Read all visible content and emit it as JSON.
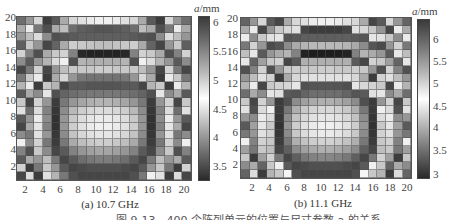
{
  "figure": {
    "caption": "图 9-13　400 个阵列单元的位置与尺寸参数 a 的关系"
  },
  "panels": [
    {
      "subcaption": "(a) 10.7 GHz",
      "colorbar_title_var": "a",
      "colorbar_title_unit": "/mm",
      "colorbar_ticks": [
        "6",
        "5.5",
        "5",
        "4.5",
        "4",
        "3.5"
      ],
      "y_ticks": [
        "20",
        "18",
        "16",
        "14",
        "12",
        "10",
        "8",
        "6",
        "4",
        "2"
      ],
      "x_ticks": [
        "2",
        "4",
        "6",
        "8",
        "10",
        "12",
        "14",
        "16",
        "18",
        "20"
      ]
    },
    {
      "subcaption": "(b) 11.1 GHz",
      "colorbar_title_var": "a",
      "colorbar_title_unit": "/mm",
      "colorbar_ticks": [
        "6",
        "5.5",
        "5",
        "4.5",
        "4",
        "3.5",
        "3"
      ],
      "y_ticks": [
        "20",
        "18",
        "16",
        "14",
        "12",
        "10",
        "8",
        "6",
        "4",
        "2"
      ],
      "x_ticks": [
        "2",
        "4",
        "6",
        "8",
        "10",
        "12",
        "14",
        "16",
        "18",
        "20"
      ]
    }
  ],
  "chart_data": [
    {
      "type": "heatmap",
      "title": "(a) 10.7 GHz",
      "xlabel": "",
      "ylabel": "",
      "x": [
        1,
        2,
        3,
        4,
        5,
        6,
        7,
        8,
        9,
        10,
        11,
        12,
        13,
        14,
        15,
        16,
        17,
        18,
        19,
        20
      ],
      "y_top_to_bottom": [
        20,
        19,
        18,
        17,
        16,
        15,
        14,
        13,
        12,
        11,
        10,
        9,
        8,
        7,
        6,
        5,
        4,
        3,
        2,
        1
      ],
      "colorbar": {
        "label": "a/mm",
        "range": [
          3.2,
          6.3
        ],
        "ticks": [
          6,
          5.5,
          5,
          4.5,
          4,
          3.5
        ],
        "colormap": "gray: dark at ends, white near 5"
      },
      "gray_levels_note": "0=black, 255=white; rows from y=20 (top) to y=1 (bottom)",
      "gray": [
        [
          110,
          150,
          215,
          60,
          90,
          170,
          215,
          225,
          235,
          240,
          240,
          235,
          225,
          215,
          170,
          90,
          60,
          215,
          150,
          110
        ],
        [
          170,
          235,
          120,
          80,
          170,
          190,
          110,
          95,
          90,
          85,
          85,
          90,
          95,
          110,
          190,
          170,
          80,
          120,
          235,
          170
        ],
        [
          150,
          190,
          220,
          140,
          80,
          85,
          90,
          95,
          95,
          95,
          95,
          95,
          95,
          90,
          85,
          80,
          140,
          220,
          190,
          150
        ],
        [
          95,
          200,
          150,
          70,
          100,
          170,
          205,
          200,
          195,
          190,
          190,
          195,
          200,
          205,
          170,
          100,
          70,
          150,
          200,
          95
        ],
        [
          210,
          130,
          80,
          170,
          200,
          210,
          130,
          40,
          35,
          35,
          35,
          35,
          40,
          130,
          210,
          200,
          170,
          80,
          130,
          210
        ],
        [
          140,
          90,
          150,
          180,
          220,
          240,
          80,
          180,
          175,
          175,
          175,
          175,
          180,
          80,
          240,
          220,
          180,
          150,
          90,
          140
        ],
        [
          70,
          120,
          210,
          70,
          150,
          190,
          200,
          200,
          200,
          205,
          205,
          200,
          200,
          200,
          190,
          150,
          70,
          210,
          120,
          70
        ],
        [
          120,
          200,
          235,
          60,
          170,
          215,
          150,
          120,
          115,
          115,
          115,
          115,
          120,
          150,
          215,
          170,
          60,
          235,
          200,
          120
        ],
        [
          180,
          235,
          60,
          200,
          180,
          70,
          90,
          90,
          85,
          85,
          85,
          85,
          90,
          90,
          70,
          180,
          200,
          60,
          235,
          180
        ],
        [
          90,
          170,
          140,
          230,
          80,
          100,
          110,
          115,
          120,
          120,
          120,
          120,
          115,
          110,
          100,
          80,
          230,
          140,
          170,
          90
        ],
        [
          200,
          70,
          210,
          150,
          60,
          120,
          150,
          165,
          175,
          180,
          180,
          175,
          165,
          150,
          120,
          60,
          150,
          210,
          70,
          200
        ],
        [
          225,
          110,
          220,
          130,
          55,
          140,
          185,
          205,
          215,
          220,
          220,
          215,
          205,
          185,
          140,
          55,
          130,
          220,
          110,
          225
        ],
        [
          90,
          150,
          235,
          140,
          50,
          150,
          200,
          220,
          230,
          235,
          235,
          230,
          220,
          200,
          150,
          50,
          140,
          235,
          150,
          90
        ],
        [
          70,
          170,
          230,
          130,
          50,
          150,
          205,
          225,
          235,
          240,
          240,
          235,
          225,
          205,
          150,
          50,
          130,
          230,
          170,
          70
        ],
        [
          140,
          120,
          225,
          150,
          55,
          140,
          195,
          215,
          225,
          230,
          230,
          225,
          215,
          195,
          140,
          55,
          150,
          225,
          120,
          140
        ],
        [
          240,
          140,
          210,
          120,
          60,
          120,
          170,
          190,
          200,
          205,
          205,
          200,
          190,
          170,
          120,
          60,
          120,
          210,
          140,
          240
        ],
        [
          130,
          80,
          200,
          140,
          70,
          90,
          130,
          150,
          160,
          165,
          165,
          160,
          150,
          130,
          90,
          70,
          140,
          200,
          80,
          130
        ],
        [
          90,
          170,
          150,
          190,
          120,
          70,
          90,
          110,
          120,
          125,
          125,
          120,
          110,
          90,
          70,
          120,
          190,
          150,
          170,
          90
        ],
        [
          210,
          60,
          120,
          200,
          150,
          90,
          70,
          75,
          80,
          80,
          80,
          80,
          75,
          70,
          90,
          150,
          200,
          120,
          60,
          210
        ],
        [
          70,
          220,
          60,
          225,
          180,
          120,
          80,
          70,
          70,
          70,
          70,
          70,
          70,
          80,
          120,
          240,
          225,
          60,
          220,
          70
        ]
      ]
    },
    {
      "type": "heatmap",
      "title": "(b) 11.1 GHz",
      "xlabel": "",
      "ylabel": "",
      "x": [
        1,
        2,
        3,
        4,
        5,
        6,
        7,
        8,
        9,
        10,
        11,
        12,
        13,
        14,
        15,
        16,
        17,
        18,
        19,
        20
      ],
      "y_top_to_bottom": [
        20,
        19,
        18,
        17,
        16,
        15,
        14,
        13,
        12,
        11,
        10,
        9,
        8,
        7,
        6,
        5,
        4,
        3,
        2,
        1
      ],
      "colorbar": {
        "label": "a/mm",
        "range": [
          2.85,
          6.5
        ],
        "ticks": [
          6,
          5.5,
          5,
          4.5,
          4,
          3.5,
          3
        ],
        "colormap": "gray: dark at ends, white near 5"
      },
      "gray_levels_note": "0=black, 255=white; rows from y=20 (top) to y=1 (bottom)",
      "gray": [
        [
          100,
          150,
          215,
          90,
          70,
          170,
          215,
          225,
          235,
          240,
          240,
          235,
          225,
          215,
          170,
          70,
          90,
          215,
          150,
          100
        ],
        [
          170,
          235,
          70,
          150,
          200,
          215,
          225,
          70,
          60,
          60,
          60,
          60,
          70,
          225,
          215,
          200,
          150,
          70,
          235,
          170
        ],
        [
          235,
          140,
          200,
          225,
          230,
          85,
          90,
          95,
          95,
          95,
          95,
          95,
          95,
          90,
          85,
          230,
          225,
          200,
          140,
          235
        ],
        [
          120,
          210,
          150,
          75,
          85,
          140,
          170,
          180,
          185,
          185,
          185,
          185,
          180,
          170,
          140,
          85,
          75,
          150,
          210,
          120
        ],
        [
          190,
          230,
          90,
          150,
          170,
          180,
          130,
          35,
          30,
          30,
          30,
          30,
          35,
          130,
          180,
          170,
          150,
          90,
          230,
          190
        ],
        [
          230,
          100,
          160,
          200,
          210,
          70,
          90,
          175,
          175,
          175,
          175,
          175,
          175,
          90,
          70,
          210,
          200,
          160,
          100,
          230
        ],
        [
          80,
          130,
          210,
          80,
          150,
          200,
          205,
          200,
          200,
          205,
          205,
          200,
          200,
          205,
          200,
          150,
          80,
          210,
          130,
          80
        ],
        [
          150,
          190,
          225,
          210,
          60,
          170,
          215,
          225,
          225,
          225,
          225,
          225,
          225,
          215,
          170,
          60,
          210,
          225,
          190,
          150
        ],
        [
          180,
          235,
          70,
          200,
          210,
          215,
          230,
          80,
          85,
          85,
          85,
          85,
          80,
          230,
          215,
          210,
          200,
          70,
          235,
          180
        ],
        [
          110,
          170,
          140,
          230,
          225,
          90,
          85,
          100,
          110,
          110,
          110,
          110,
          100,
          85,
          90,
          225,
          230,
          140,
          170,
          110
        ],
        [
          200,
          70,
          210,
          150,
          60,
          80,
          140,
          160,
          170,
          175,
          175,
          170,
          160,
          140,
          80,
          60,
          150,
          210,
          70,
          200
        ],
        [
          225,
          80,
          220,
          240,
          60,
          120,
          175,
          200,
          210,
          215,
          215,
          210,
          200,
          175,
          120,
          60,
          240,
          220,
          80,
          225
        ],
        [
          150,
          140,
          235,
          220,
          55,
          140,
          195,
          215,
          225,
          230,
          230,
          225,
          215,
          195,
          140,
          55,
          220,
          235,
          140,
          150
        ],
        [
          90,
          160,
          230,
          200,
          50,
          150,
          205,
          225,
          235,
          240,
          240,
          235,
          225,
          205,
          150,
          50,
          200,
          230,
          160,
          90
        ],
        [
          120,
          150,
          225,
          210,
          55,
          140,
          200,
          220,
          230,
          235,
          235,
          230,
          220,
          200,
          140,
          55,
          210,
          225,
          150,
          120
        ],
        [
          240,
          130,
          210,
          200,
          60,
          120,
          175,
          195,
          205,
          210,
          210,
          205,
          195,
          175,
          120,
          60,
          200,
          210,
          130,
          240
        ],
        [
          160,
          120,
          200,
          190,
          70,
          95,
          140,
          160,
          170,
          175,
          175,
          170,
          160,
          140,
          95,
          70,
          190,
          200,
          120,
          160
        ],
        [
          200,
          60,
          160,
          210,
          120,
          70,
          95,
          120,
          130,
          135,
          135,
          130,
          120,
          95,
          70,
          120,
          210,
          160,
          60,
          200
        ],
        [
          140,
          170,
          100,
          200,
          240,
          90,
          70,
          75,
          80,
          80,
          80,
          80,
          75,
          70,
          90,
          240,
          200,
          100,
          170,
          140
        ],
        [
          100,
          220,
          60,
          180,
          200,
          245,
          80,
          70,
          70,
          70,
          70,
          70,
          70,
          80,
          245,
          200,
          180,
          60,
          220,
          100
        ]
      ]
    }
  ]
}
